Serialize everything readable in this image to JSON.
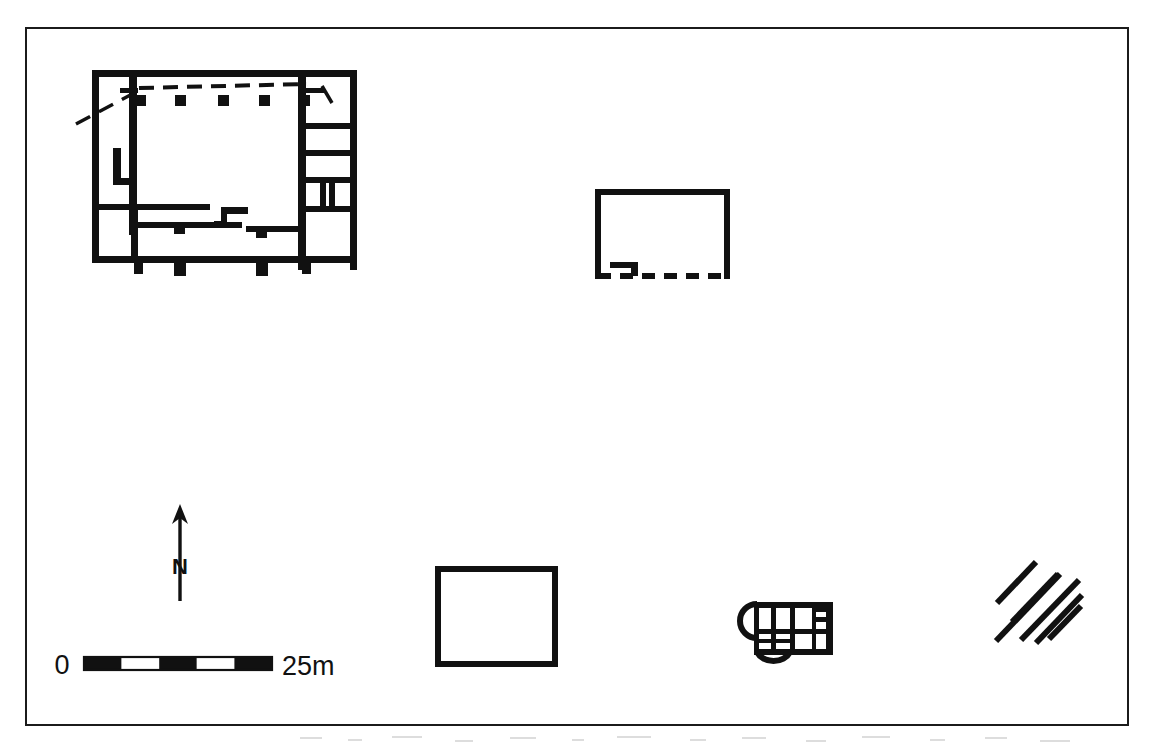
{
  "figure": {
    "kind": "archaeological-site-plan",
    "frame": {
      "x": 26,
      "y": 28,
      "width": 1102,
      "height": 697,
      "stroke": "#1b1b1b",
      "stroke_width": 2
    },
    "canvas": {
      "width": 1155,
      "height": 750,
      "background": "#ffffff"
    },
    "ink_color": "#111111"
  },
  "scale_bar": {
    "name": "scale-bar",
    "start_label": "0",
    "end_label": "25m",
    "units": "m",
    "length_value": 25,
    "x": 84,
    "y": 657,
    "width": 188,
    "height": 13,
    "segments": 5,
    "segment_fills": [
      "black",
      "white",
      "black",
      "white",
      "black"
    ],
    "label_left_x": 62,
    "label_right_x": 282,
    "label_baseline_y": 673,
    "font_size": 27
  },
  "north_arrow": {
    "name": "north-arrow",
    "label": "N",
    "x": 180,
    "tip_y": 505,
    "tail_y": 600,
    "label_x": 180,
    "label_y": 572,
    "font_size": 21,
    "stroke_width": 3
  },
  "structures": [
    {
      "id": "main-building",
      "name": "main-building-complex",
      "label": "",
      "description": "Large rectangular multi-room building with columned north portico, east wing of five rooms, and south corridor with buttresses",
      "bbox": {
        "x": 92,
        "y": 70,
        "width": 265,
        "height": 200
      },
      "features": [
        "dashed-portico-line",
        "five-column-bases",
        "east-wing-rooms",
        "south-corridor",
        "buttress-blocks",
        "l-shaped-stub-wall",
        "diagonal-dashed-projection"
      ]
    },
    {
      "id": "north-east-enclosure",
      "name": "dashed-wall-enclosure",
      "label": "",
      "description": "Rectangular enclosure, three solid walls, dashed (reconstructed) south wall with internal stub",
      "bbox": {
        "x": 595,
        "y": 189,
        "width": 135,
        "height": 90
      },
      "features": [
        "dashed-south-wall",
        "internal-stub-wall"
      ]
    },
    {
      "id": "south-square",
      "name": "square-enclosure",
      "label": "",
      "description": "Simple open square enclosure",
      "bbox": {
        "x": 435,
        "y": 566,
        "width": 123,
        "height": 101
      },
      "features": []
    },
    {
      "id": "apsidal-building",
      "name": "apsidal-building",
      "label": "",
      "description": "Small apsidal building with west apse, south apse, and multiple internal compartments",
      "bbox": {
        "x": 733,
        "y": 602,
        "width": 100,
        "height": 62
      },
      "features": [
        "west-apse",
        "south-apse",
        "internal-compartments"
      ]
    },
    {
      "id": "hatched-area",
      "name": "hatched-area",
      "label": "",
      "description": "Six parallel diagonal hatch strokes indicating rubble or unexcavated deposit",
      "bbox": {
        "x": 993,
        "y": 551,
        "width": 88,
        "height": 88
      },
      "features": [
        "diagonal-hatching"
      ],
      "stroke_count": 6
    }
  ]
}
